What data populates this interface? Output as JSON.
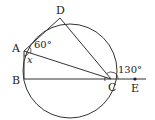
{
  "diagram": {
    "type": "circle-inscribed-quadrilateral",
    "circle": {
      "cx": 70,
      "cy": 71,
      "r": 47
    },
    "points": {
      "A": {
        "label": "A",
        "x": 24,
        "y": 51
      },
      "B": {
        "label": "B",
        "x": 24,
        "y": 79
      },
      "C": {
        "label": "C",
        "x": 111,
        "y": 79
      },
      "D": {
        "label": "D",
        "x": 60,
        "y": 18
      },
      "E": {
        "label": "E",
        "x": 135,
        "y": 79
      }
    },
    "angles": {
      "angle_DAC": "60°",
      "angle_BAC": "x",
      "angle_DCE": "130°"
    },
    "colors": {
      "line": "#333333",
      "background": "#ffffff"
    }
  }
}
